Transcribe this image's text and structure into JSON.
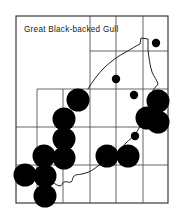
{
  "figure": {
    "kind": "species-distribution-map",
    "title": "Great Black-backed Gull",
    "title_position": {
      "x": 24,
      "y": 32
    },
    "colors": {
      "ink": "#000000",
      "background": "#ffffff",
      "grid": "#555555",
      "border": "#3a3a3a",
      "coastline": "#222222",
      "dot_fill": "#000000"
    }
  },
  "map_frame": {
    "x": 16,
    "y": 16,
    "width": 152,
    "height": 187,
    "border_width": 1.2
  },
  "grid": {
    "visible": true,
    "stroke_width": 0.9,
    "vertical_lines": [
      {
        "name": "v1",
        "x": 37,
        "y1": 89,
        "y2": 203
      },
      {
        "name": "v2",
        "x": 63,
        "y1": 89,
        "y2": 203
      },
      {
        "name": "v3",
        "x": 90,
        "y1": 16,
        "y2": 203
      },
      {
        "name": "v4",
        "x": 116,
        "y1": 16,
        "y2": 203
      },
      {
        "name": "v5",
        "x": 143,
        "y1": 16,
        "y2": 203
      }
    ],
    "horizontal_lines": [
      {
        "name": "h1",
        "y": 51,
        "x1": 90,
        "x2": 168
      },
      {
        "name": "h2",
        "y": 89,
        "x1": 37,
        "x2": 168
      },
      {
        "name": "h3",
        "y": 127,
        "x1": 16,
        "x2": 168
      },
      {
        "name": "h4",
        "y": 165,
        "x1": 16,
        "x2": 168
      }
    ]
  },
  "coastline": {
    "name": "state-coastline-outline",
    "stroke_width": 1.0,
    "path": "M 88 89 C 92 82, 98 74, 104 68 C 110 62, 118 56, 126 52 C 131 49, 136 46, 140 44 L 141 38 L 148 39 L 148 50 C 149 58, 150 66, 152 72 C 154 77, 157 80, 158 84 C 156 87, 153 89, 152 93 C 151 97, 152 101, 150 105 C 148 110, 145 114, 143 119 C 141 124, 139 129, 136 133 C 133 137, 129 140, 126 143 C 123 146, 121 149, 118 152 C 114 155, 110 157, 106 160 C 102 163, 98 166, 94 169 C 90 172, 86 173, 82 174 C 79 175, 76 174, 74 176 C 72 178, 73 181, 71 182 C 69 183, 66 181, 64 182 C 62 183, 62 186, 60 186 C 57 186, 55 183, 53 183 C 50 183, 48 186, 46 185 C 44 184, 44 181, 42 180 C 40 179, 37 180, 36 179"
  },
  "records": {
    "legend_note": "filled circles = occupied survey squares",
    "large_dots": {
      "radius": 11.5,
      "points": [
        {
          "cx": 78,
          "cy": 100
        },
        {
          "cx": 64,
          "cy": 119
        },
        {
          "cx": 64,
          "cy": 139
        },
        {
          "cx": 64,
          "cy": 158
        },
        {
          "cx": 44,
          "cy": 156
        },
        {
          "cx": 45,
          "cy": 176
        },
        {
          "cx": 25,
          "cy": 175
        },
        {
          "cx": 45,
          "cy": 196
        },
        {
          "cx": 107,
          "cy": 156
        },
        {
          "cx": 128,
          "cy": 156
        },
        {
          "cx": 147,
          "cy": 118
        },
        {
          "cx": 158,
          "cy": 101
        },
        {
          "cx": 158,
          "cy": 122
        }
      ]
    },
    "small_dots": {
      "radius": 4.2,
      "points": [
        {
          "cx": 156,
          "cy": 43
        },
        {
          "cx": 116,
          "cy": 79
        },
        {
          "cx": 134,
          "cy": 95
        },
        {
          "cx": 135,
          "cy": 136
        }
      ]
    }
  }
}
